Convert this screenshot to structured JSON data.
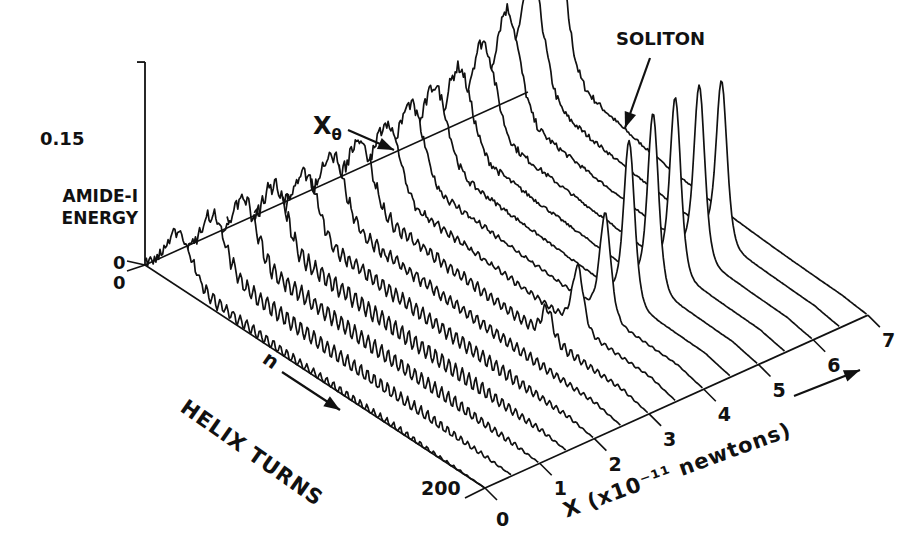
{
  "chart_data": {
    "type": "line",
    "subtype": "3d-waterfall",
    "title": "",
    "xlabel": "X (x10^-11 newtons)",
    "ylabel": "HELIX TURNS",
    "zlabel": "AMIDE-I ENERGY",
    "x_axis": {
      "label": "X (x10⁻¹¹ newtons)",
      "ticks": [
        0,
        1,
        2,
        3,
        4,
        5,
        6,
        7
      ],
      "range": [
        0,
        7
      ]
    },
    "n_axis": {
      "label": "HELIX TURNS",
      "direction_label": "n",
      "ticks": [
        0,
        200
      ],
      "range": [
        0,
        200
      ]
    },
    "energy_axis": {
      "label": "AMIDE-I ENERGY",
      "ticks": [
        0,
        0.15
      ],
      "range": [
        0,
        0.15
      ]
    },
    "annotations": [
      {
        "text": "SOLITON",
        "points_to": {
          "X": 4.0,
          "n": 140,
          "energy": 0.13
        }
      },
      {
        "text": "Xθ",
        "points_to": {
          "X": 2.5,
          "n": 0,
          "energy": 0.0
        }
      }
    ],
    "series": [
      {
        "X": 0.0,
        "early_peak_n": 20,
        "early_peak_e": 0.03,
        "noise_e": 0.01,
        "decay_n": 40,
        "soliton_n": null,
        "soliton_e": 0,
        "wiggle": 0.004
      },
      {
        "X": 0.5,
        "early_peak_n": 24,
        "early_peak_e": 0.034,
        "noise_e": 0.012,
        "decay_n": 60,
        "soliton_n": null,
        "soliton_e": 0,
        "wiggle": 0.006
      },
      {
        "X": 1.0,
        "early_peak_n": 26,
        "early_peak_e": 0.038,
        "noise_e": 0.012,
        "decay_n": 80,
        "soliton_n": null,
        "soliton_e": 0,
        "wiggle": 0.006
      },
      {
        "X": 1.5,
        "early_peak_n": 28,
        "early_peak_e": 0.04,
        "noise_e": 0.013,
        "decay_n": 95,
        "soliton_n": null,
        "soliton_e": 0,
        "wiggle": 0.006
      },
      {
        "X": 2.0,
        "early_peak_n": 30,
        "early_peak_e": 0.042,
        "noise_e": 0.014,
        "decay_n": 110,
        "soliton_n": null,
        "soliton_e": 0,
        "wiggle": 0.005
      },
      {
        "X": 2.5,
        "early_peak_n": 30,
        "early_peak_e": 0.044,
        "noise_e": 0.015,
        "decay_n": 125,
        "soliton_n": null,
        "soliton_e": 0,
        "wiggle": 0.004
      },
      {
        "X": 3.0,
        "early_peak_n": 30,
        "early_peak_e": 0.046,
        "noise_e": 0.015,
        "decay_n": 135,
        "soliton_n": 140,
        "soliton_e": 0.022,
        "wiggle": 0.004
      },
      {
        "X": 3.5,
        "early_peak_n": 30,
        "early_peak_e": 0.048,
        "noise_e": 0.016,
        "decay_n": 140,
        "soliton_n": 142,
        "soliton_e": 0.045,
        "wiggle": 0.002
      },
      {
        "X": 4.0,
        "early_peak_n": 28,
        "early_peak_e": 0.05,
        "noise_e": 0.016,
        "decay_n": 130,
        "soliton_n": 142,
        "soliton_e": 0.075,
        "wiggle": 0.001
      },
      {
        "X": 4.5,
        "early_peak_n": 26,
        "early_peak_e": 0.052,
        "noise_e": 0.017,
        "decay_n": 120,
        "soliton_n": 140,
        "soliton_e": 0.118,
        "wiggle": 0.0
      },
      {
        "X": 5.0,
        "early_peak_n": 24,
        "early_peak_e": 0.054,
        "noise_e": 0.018,
        "decay_n": 110,
        "soliton_n": 138,
        "soliton_e": 0.128,
        "wiggle": 0.0
      },
      {
        "X": 5.5,
        "early_peak_n": 22,
        "early_peak_e": 0.06,
        "noise_e": 0.018,
        "decay_n": 100,
        "soliton_n": 135,
        "soliton_e": 0.128,
        "wiggle": 0.0
      },
      {
        "X": 6.0,
        "early_peak_n": 20,
        "early_peak_e": 0.07,
        "noise_e": 0.018,
        "decay_n": 90,
        "soliton_n": 133,
        "soliton_e": 0.126,
        "wiggle": 0.0
      },
      {
        "X": 6.5,
        "early_peak_n": 18,
        "early_peak_e": 0.08,
        "noise_e": 0.018,
        "decay_n": 80,
        "soliton_n": 130,
        "soliton_e": 0.118,
        "wiggle": 0.0
      },
      {
        "X": 7.0,
        "early_peak_n": 14,
        "early_peak_e": 0.11,
        "noise_e": 0.02,
        "decay_n": 60,
        "soliton_n": null,
        "soliton_e": 0,
        "wiggle": 0.0
      }
    ]
  },
  "labels": {
    "energy_title_line1": "AMIDE-I",
    "energy_title_line2": "ENERGY",
    "energy_tick_max": "0.15",
    "energy_tick_zero": "0",
    "n_tick_zero": "0",
    "n_tick_max": "200",
    "n_title": "HELIX TURNS",
    "n_letter": "n",
    "x_title": "X (x10⁻¹¹ newtons)",
    "x_theta_main": "X",
    "x_theta_sub": "θ",
    "soliton": "SOLITON",
    "x_ticks": [
      "0",
      "1",
      "2",
      "3",
      "4",
      "5",
      "6",
      "7"
    ]
  },
  "geometry": {
    "origin": [
      145,
      265
    ],
    "n_vec": [
      1.7,
      1.115
    ],
    "x_vec": [
      54.7,
      -24.7
    ],
    "e_scale": 1353,
    "line_color": "#111111",
    "background": "#ffffff"
  }
}
